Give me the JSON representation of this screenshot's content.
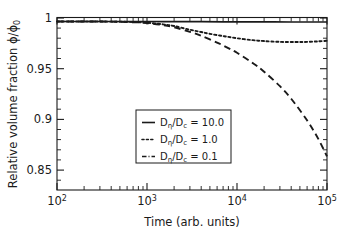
{
  "chart_data": {
    "type": "line",
    "title": "",
    "xlabel": "Time (arb. units)",
    "ylabel": "Relative volume fraction ϕ/ϕ₀",
    "ylabel_main": "Relative volume fraction ",
    "ylabel_symbol": "ϕ/ϕ",
    "ylabel_symbol_sub": "0",
    "xscale": "log",
    "yscale": "linear",
    "xlim": [
      100,
      100000
    ],
    "ylim": [
      0.832,
      1.004
    ],
    "grid": false,
    "legend_position": "center",
    "x_tick_labels": [
      "10²",
      "10³",
      "10⁴",
      "10⁵"
    ],
    "x_tick_values": [
      100,
      1000,
      10000,
      100000
    ],
    "x_tick_mantissa": [
      "10",
      "10",
      "10",
      "10"
    ],
    "x_tick_exponents": [
      "2",
      "3",
      "4",
      "5"
    ],
    "y_tick_labels": [
      "1",
      "0.95",
      "0.9",
      "0.85"
    ],
    "y_tick_values": [
      1,
      0.95,
      0.9,
      0.85
    ],
    "series": [
      {
        "name": "Dη/Dc = 10.0",
        "label_prefix": "D",
        "label_sub1": "η",
        "label_mid": "/D",
        "label_sub2": "c",
        "label_value": " = 10.0",
        "style": "solid",
        "x": [
          100,
          200,
          400,
          700,
          1000,
          2000,
          4000,
          7000,
          10000,
          20000,
          40000,
          70000,
          100000
        ],
        "y": [
          1.0,
          1.0,
          1.0,
          1.0,
          1.0,
          0.9999,
          0.9998,
          0.9997,
          0.9997,
          0.9996,
          0.9995,
          0.9995,
          0.9995
        ]
      },
      {
        "name": "Dη/Dc = 1.0",
        "label_prefix": "D",
        "label_sub1": "η",
        "label_mid": "/D",
        "label_sub2": "c",
        "label_value": " = 1.0",
        "style": "dotted",
        "x": [
          100,
          300,
          700,
          1000,
          1500,
          2000,
          3000,
          4000,
          5000,
          7000,
          10000,
          15000,
          20000,
          30000,
          45000,
          60000,
          80000,
          100000
        ],
        "y": [
          1.0,
          1.0,
          0.9995,
          0.9988,
          0.9972,
          0.9955,
          0.9918,
          0.9895,
          0.9877,
          0.9855,
          0.9833,
          0.9814,
          0.9805,
          0.9797,
          0.9795,
          0.9797,
          0.9802,
          0.9808
        ]
      },
      {
        "name": "Dη/Dc = 0.1",
        "label_prefix": "D",
        "label_sub1": "η",
        "label_mid": "/D",
        "label_sub2": "c",
        "label_value": " = 0.1",
        "style": "dashed",
        "x": [
          100,
          300,
          700,
          1000,
          1500,
          2000,
          3000,
          4000,
          6000,
          8000,
          10000,
          15000,
          20000,
          30000,
          40000,
          60000,
          80000,
          100000
        ],
        "y": [
          1.0,
          1.0,
          0.9993,
          0.9985,
          0.9965,
          0.9943,
          0.9897,
          0.9857,
          0.979,
          0.9735,
          0.9688,
          0.9585,
          0.95,
          0.9355,
          0.923,
          0.9015,
          0.883,
          0.8655
        ]
      }
    ]
  },
  "legend": {
    "entries": [
      {
        "sample": "solid",
        "text": "= 10.0"
      },
      {
        "sample": "dotted",
        "text": "= 1.0"
      },
      {
        "sample": "dashdot",
        "text": "= 0.1"
      }
    ]
  },
  "axes": {
    "x_label": "Time (arb. units)",
    "y_label": "Relative volume fraction"
  },
  "colors": {
    "ink": "#1a1a1a",
    "background": "#ffffff"
  }
}
